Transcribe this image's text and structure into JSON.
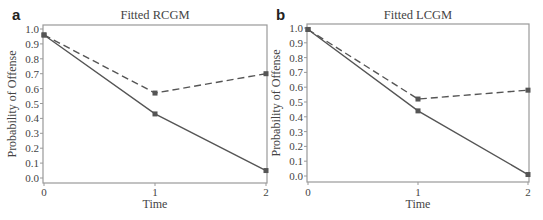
{
  "chart_data": [
    {
      "type": "line",
      "panel": "a",
      "title": "Fitted RCGM",
      "xlabel": "Time",
      "ylabel": "Probability of Offense",
      "x": [
        0,
        1,
        2
      ],
      "xticks": [
        "0",
        "1",
        "2"
      ],
      "yticks": [
        "0.0",
        "0.1",
        "0.2",
        "0.3",
        "0.4",
        "0.5",
        "0.6",
        "0.7",
        "0.8",
        "0.9",
        "1.0"
      ],
      "ylim": [
        0,
        1
      ],
      "series": [
        {
          "name": "solid",
          "style": "solid",
          "values": [
            0.96,
            0.43,
            0.05
          ]
        },
        {
          "name": "dashed",
          "style": "dashed",
          "values": [
            0.96,
            0.57,
            0.7
          ]
        }
      ]
    },
    {
      "type": "line",
      "panel": "b",
      "title": "Fitted LCGM",
      "xlabel": "Time",
      "ylabel": "Probability of Offense",
      "x": [
        0,
        1,
        2
      ],
      "xticks": [
        "0",
        "1",
        "2"
      ],
      "yticks": [
        "0.0",
        "0.1",
        "0.2",
        "0.3",
        "0.4",
        "0.5",
        "0.6",
        "0.7",
        "0.8",
        "0.9",
        "1.0"
      ],
      "ylim": [
        0,
        1
      ],
      "series": [
        {
          "name": "solid",
          "style": "solid",
          "values": [
            0.99,
            0.44,
            0.01
          ]
        },
        {
          "name": "dashed",
          "style": "dashed",
          "values": [
            0.99,
            0.52,
            0.58
          ]
        }
      ]
    }
  ],
  "colors": {
    "line": "#555555",
    "frame": "#999999",
    "text": "#444444"
  }
}
